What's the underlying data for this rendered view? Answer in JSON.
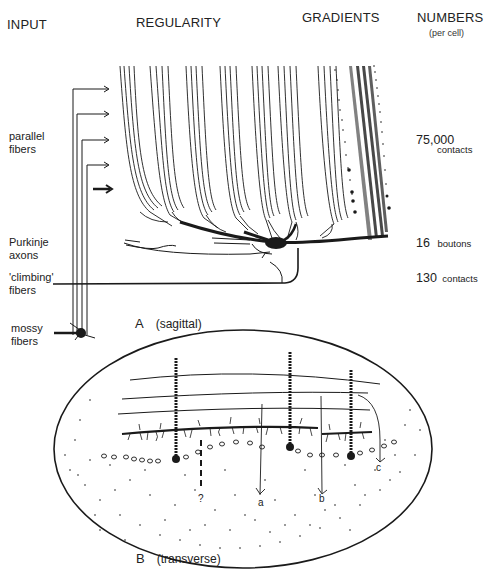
{
  "headers": {
    "input": "INPUT",
    "regularity": "REGULARITY",
    "gradients": "GRADIENTS",
    "numbers": "NUMBERS",
    "numbers_sub": "(per cell)"
  },
  "input_labels": {
    "parallel": [
      "parallel",
      "fibers"
    ],
    "purkinje": [
      "Purkinje",
      "axons"
    ],
    "climbing": [
      "'climbing'",
      "fibers"
    ],
    "mossy": [
      "mossy",
      "fibers"
    ]
  },
  "numbers": [
    {
      "value": "75,000",
      "unit": "contacts"
    },
    {
      "value": "16",
      "unit": "boutons"
    },
    {
      "value": "130",
      "unit": "contacts"
    }
  ],
  "panels": {
    "a": {
      "letter": "A",
      "view": "(sagittal)"
    },
    "b": {
      "letter": "B",
      "view": "(transverse)"
    }
  },
  "panel_b_markers": [
    "?",
    "a",
    "b",
    "c"
  ],
  "colors": {
    "ink": "#1a1a1a",
    "background": "#ffffff"
  }
}
